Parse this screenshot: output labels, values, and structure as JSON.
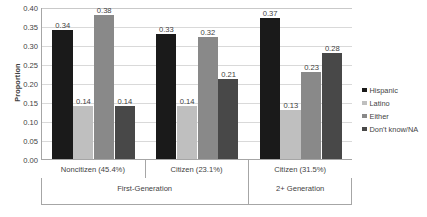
{
  "chart_data": {
    "type": "bar",
    "title": "",
    "xlabel": "",
    "ylabel": "Proportion",
    "ylim": [
      0.0,
      0.4
    ],
    "ytick_labels": [
      "0.40",
      "0.35",
      "0.30",
      "0.25",
      "0.20",
      "0.15",
      "0.10",
      "0.05",
      "0.00"
    ],
    "ytick_values": [
      0.4,
      0.35,
      0.3,
      0.25,
      0.2,
      0.15,
      0.1,
      0.05,
      0.0
    ],
    "grid": true,
    "legend_position": "right",
    "categories": [
      "Noncitizen (45.4%)",
      "Citizen (23.1%)",
      "Citizen (31.5%)"
    ],
    "category_groups": [
      {
        "label": "First-Generation",
        "categories": [
          "Noncitizen (45.4%)",
          "Citizen (23.1%)"
        ]
      },
      {
        "label": "2+ Generation",
        "categories": [
          "Citizen (31.5%)"
        ]
      }
    ],
    "series": [
      {
        "name": "Hispanic",
        "color": "#1a1a1a",
        "values": [
          0.34,
          0.33,
          0.37
        ],
        "labels": [
          "0.34",
          "0.33",
          "0.37"
        ]
      },
      {
        "name": "Latino",
        "color": "#bfbfbf",
        "values": [
          0.14,
          0.14,
          0.13
        ],
        "labels": [
          "0.14",
          "0.14",
          "0.13"
        ]
      },
      {
        "name": "Either",
        "color": "#898989",
        "values": [
          0.38,
          0.32,
          0.23
        ],
        "labels": [
          "0.38",
          "0.32",
          "0.23"
        ]
      },
      {
        "name": "Don't know/NA",
        "color": "#484848",
        "values": [
          0.14,
          0.21,
          0.28
        ],
        "labels": [
          "0.14",
          "0.21",
          "0.28"
        ]
      }
    ]
  },
  "legend": {
    "items": [
      {
        "label": "Hispanic",
        "color": "#1a1a1a"
      },
      {
        "label": "Latino",
        "color": "#bfbfbf"
      },
      {
        "label": "Either",
        "color": "#898989"
      },
      {
        "label": "Don't know/NA",
        "color": "#484848"
      }
    ]
  }
}
